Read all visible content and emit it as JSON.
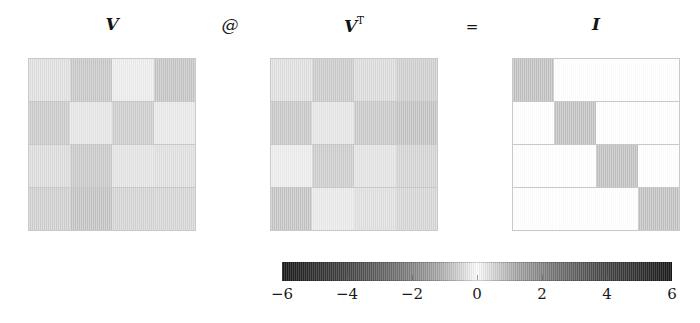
{
  "figure": {
    "title": "",
    "background": "#ffffff",
    "width": 700,
    "height": 323
  },
  "labels": {
    "v": "V",
    "vt_base": "V",
    "vt_sup": "T",
    "matmul_operator": "@",
    "equals_operator": "=",
    "identity": "I"
  },
  "chart_data": {
    "type": "heatmap",
    "title": "",
    "xlabel": "",
    "ylabel": "",
    "grid": true,
    "legend_position": "bottom",
    "colormap": {
      "name": "diverging-gray",
      "vmin": -6,
      "vmax": 6,
      "center": 0,
      "center_color": "#ffffff",
      "extreme_color": "#1b1b1b"
    },
    "colorbar": {
      "orientation": "horizontal",
      "ticks": [
        -6,
        -4,
        -2,
        0,
        2,
        4,
        6
      ],
      "ticklabels": [
        "−6",
        "−4",
        "−2",
        "0",
        "2",
        "4",
        "6"
      ],
      "range": [
        -6,
        6
      ]
    },
    "panels": [
      {
        "name": "V",
        "label": "V",
        "rows": 4,
        "cols": 4,
        "values": [
          [
            -0.4,
            0.86,
            -0.19,
            0.92
          ],
          [
            0.79,
            -0.3,
            0.74,
            -0.24
          ],
          [
            -0.47,
            0.81,
            -0.33,
            -0.4
          ],
          [
            0.7,
            -0.96,
            0.62,
            0.57
          ]
        ]
      },
      {
        "name": "VT",
        "label": "V^T",
        "rows": 4,
        "cols": 4,
        "values": [
          [
            -0.4,
            0.79,
            -0.47,
            0.7
          ],
          [
            0.86,
            -0.3,
            0.81,
            -0.96
          ],
          [
            -0.19,
            0.74,
            -0.33,
            0.62
          ],
          [
            0.92,
            -0.24,
            -0.4,
            0.57
          ]
        ]
      },
      {
        "name": "I",
        "label": "I",
        "rows": 4,
        "cols": 4,
        "values": [
          [
            1,
            0,
            0,
            0
          ],
          [
            0,
            1,
            0,
            0
          ],
          [
            0,
            0,
            1,
            0
          ],
          [
            0,
            0,
            0,
            1
          ]
        ]
      }
    ]
  }
}
